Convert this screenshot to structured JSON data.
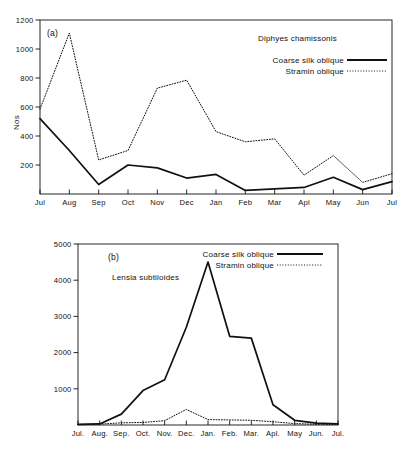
{
  "figure": {
    "background_color": "#ffffff",
    "line_color": "#111111",
    "panels": [
      "a",
      "b"
    ]
  },
  "panel_a": {
    "letter": "(a)",
    "species": "Diphyes chamissonis",
    "ylabel": "Nos",
    "legend": [
      {
        "label": "Coarse silk oblique",
        "style": "solid"
      },
      {
        "label": "Stramin oblique",
        "style": "dotted"
      }
    ]
  },
  "panel_b": {
    "letter": "(b)",
    "species": "Lensia subtiloides",
    "ylabel": "Nos.",
    "legend": [
      {
        "label": "Coarse silk oblique",
        "style": "solid"
      },
      {
        "label": "Stramin oblique",
        "style": "dotted"
      }
    ]
  },
  "chart_data": [
    {
      "type": "line",
      "panel": "a",
      "title": "Diphyes chamissonis",
      "xlabel": "",
      "ylabel": "Nos",
      "categories": [
        "Jul",
        "Aug",
        "Sep",
        "Oct",
        "Nov",
        "Dec",
        "Jan",
        "Feb",
        "Mar",
        "Apl",
        "May",
        "Jun",
        "Jul"
      ],
      "x_tick_labels": [
        "Jul",
        "Aug",
        "Sep",
        "Oct",
        "Nov",
        "Dec",
        "Jan",
        "Feb",
        "Mar",
        "Apl",
        "May",
        "Jun",
        "Jul"
      ],
      "y_tick_labels": [
        "200",
        "400",
        "600",
        "800",
        "1000",
        "1200"
      ],
      "y_ticks": [
        200,
        400,
        600,
        800,
        1000,
        1200
      ],
      "ylim": [
        0,
        1200
      ],
      "grid": false,
      "legend_position": "top-right",
      "series": [
        {
          "name": "Coarse silk oblique",
          "style": "solid",
          "values": [
            520,
            300,
            65,
            200,
            180,
            110,
            135,
            25,
            35,
            45,
            115,
            30,
            85
          ]
        },
        {
          "name": "Stramin oblique",
          "style": "dotted",
          "values": [
            585,
            1110,
            235,
            300,
            730,
            785,
            430,
            360,
            380,
            130,
            265,
            80,
            140
          ]
        }
      ]
    },
    {
      "type": "line",
      "panel": "b",
      "title": "Lensia subtiloides",
      "xlabel": "",
      "ylabel": "Nos.",
      "categories": [
        "Jul",
        "Aug",
        "Sep",
        "Oct",
        "Nov",
        "Dec",
        "Jan",
        "Feb",
        "Mar",
        "Apl",
        "May",
        "Jun",
        "Jul"
      ],
      "x_tick_labels": [
        "Jul.",
        "Aug.",
        "Sep.",
        "Oct.",
        "Nov.",
        "Dec.",
        "Jan.",
        "Feb.",
        "Mar.",
        "Apl.",
        "May",
        "Jun.",
        "Jul."
      ],
      "y_tick_labels": [
        "1000",
        "2000",
        "3000",
        "4000",
        "5000"
      ],
      "y_ticks": [
        1000,
        2000,
        3000,
        4000,
        5000
      ],
      "ylim": [
        0,
        5000
      ],
      "grid": false,
      "legend_position": "top-center",
      "series": [
        {
          "name": "Coarse silk oblique",
          "style": "solid",
          "values": [
            20,
            30,
            300,
            950,
            1250,
            2700,
            4500,
            2450,
            2400,
            560,
            130,
            50,
            30
          ]
        },
        {
          "name": "Stramin oblique",
          "style": "dotted",
          "values": [
            15,
            25,
            60,
            70,
            120,
            430,
            150,
            140,
            130,
            90,
            40,
            20,
            15
          ]
        }
      ]
    }
  ]
}
